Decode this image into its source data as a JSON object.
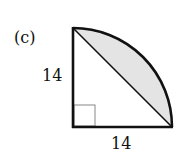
{
  "figure": {
    "label": "(c)",
    "left_side": "14",
    "bottom_side": "14",
    "shape": "quarter circle with inscribed right triangle; segment between chord and arc shaded",
    "colors": {
      "stroke": "#111111",
      "shade": "#e4e4e4",
      "right_angle_mark": "#888888"
    }
  }
}
